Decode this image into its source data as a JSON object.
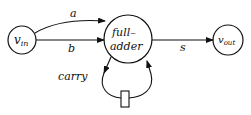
{
  "diagram": {
    "nodes": [
      {
        "id": "vin",
        "label": "v",
        "subscript": "in",
        "cx": 22,
        "cy": 40,
        "r": 14
      },
      {
        "id": "fa",
        "label_line1": "full–",
        "label_line2": "adder",
        "cx": 128,
        "cy": 39,
        "r": 24
      },
      {
        "id": "vout",
        "label": "v",
        "subscript": "out",
        "cx": 228,
        "cy": 40,
        "r": 15
      }
    ],
    "edges": [
      {
        "from": "vin",
        "to": "fa",
        "label": "a"
      },
      {
        "from": "vin",
        "to": "fa",
        "label": "b"
      },
      {
        "from": "fa",
        "to": "vout",
        "label": "s"
      },
      {
        "from": "fa",
        "to": "fa",
        "label": "carry",
        "via": "delay"
      }
    ],
    "delay_element": {
      "label": ""
    },
    "colors": {
      "stroke": "#111111",
      "background": "#ffffff"
    }
  }
}
